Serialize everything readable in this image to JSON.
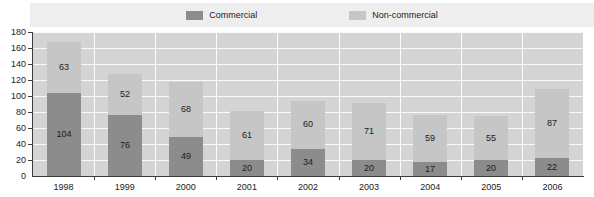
{
  "chart_data": {
    "type": "bar",
    "subtype": "stacked-column",
    "title": "",
    "xlabel": "",
    "ylabel": "",
    "categories": [
      "1998",
      "1999",
      "2000",
      "2001",
      "2002",
      "2003",
      "2004",
      "2005",
      "2006"
    ],
    "series": [
      {
        "name": "Commercial",
        "color": "#8c8c8c",
        "values": [
          104,
          76,
          49,
          20,
          34,
          20,
          17,
          20,
          22
        ]
      },
      {
        "name": "Non-commercial",
        "color": "#c6c6c6",
        "values": [
          63,
          52,
          68,
          61,
          60,
          71,
          59,
          55,
          87
        ]
      }
    ],
    "totals": [
      167,
      128,
      117,
      81,
      94,
      91,
      76,
      75,
      109
    ],
    "ylim": [
      0,
      180
    ],
    "yticks": [
      0,
      20,
      40,
      60,
      80,
      100,
      120,
      140,
      160,
      180
    ],
    "ytick_labels": [
      "0",
      "20",
      "40",
      "60",
      "80",
      "100",
      "120",
      "140",
      "160",
      "180"
    ],
    "grid": "horizontal-and-vertical",
    "grid_color": "#fbfbfb",
    "plot_background": "#d4d4d4",
    "legend_position": "top-center",
    "data_labels": true
  },
  "legend": {
    "background": "#eeeeee",
    "entries": [
      {
        "label": "Commercial",
        "color": "#8c8c8c"
      },
      {
        "label": "Non-commercial",
        "color": "#c6c6c6"
      }
    ]
  }
}
